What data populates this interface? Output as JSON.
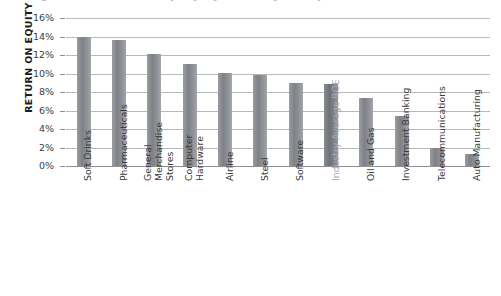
{
  "title_sliver": "Figure 1  Return on Equity by Industry Group",
  "axis": {
    "y_title": "RETURN ON EQUITY",
    "y_ticks": [
      "0%",
      "2%",
      "4%",
      "6%",
      "8%",
      "10%",
      "12%",
      "14%",
      "16%"
    ]
  },
  "colors": {
    "bar": "#85888d",
    "bar_highlight": "#75787d",
    "gridline": "#b6b8ba",
    "axis_text": "#3d3d3d",
    "muted_label": "#a8abb0"
  },
  "chart_data": {
    "type": "bar",
    "title": "Figure 1  Return on Equity by Industry Group",
    "xlabel": "",
    "ylabel": "RETURN ON EQUITY",
    "ylim": [
      0,
      16
    ],
    "ytick_values": [
      0,
      2,
      4,
      6,
      8,
      10,
      12,
      14,
      16
    ],
    "ytick_labels": [
      "0%",
      "2%",
      "4%",
      "6%",
      "8%",
      "10%",
      "12%",
      "14%",
      "16%"
    ],
    "y_unit": "percent",
    "grid": true,
    "legend": false,
    "orientation": "vertical",
    "categories": [
      "Soft Drinks",
      "Pharmaceuticals",
      "General Merchandise Stores",
      "Computer Hardware",
      "Airline",
      "Steel",
      "Software",
      "Industry Average ROE",
      "Oil and Gas",
      "Investment Banking",
      "Telecommunications",
      "Auto Manufacturing"
    ],
    "category_lines": [
      [
        "Soft Drinks"
      ],
      [
        "Pharmaceuticals"
      ],
      [
        "General",
        "Merchandise",
        "Stores"
      ],
      [
        "Computer",
        "Hardware"
      ],
      [
        "Airline"
      ],
      [
        "Steel"
      ],
      [
        "Software"
      ],
      [
        "Industry Average ROE"
      ],
      [
        "Oil and Gas"
      ],
      [
        "Investment Banking"
      ],
      [
        "Telecommunications"
      ],
      [
        "Auto Manufacturing"
      ]
    ],
    "values": [
      14.0,
      13.6,
      12.1,
      11.0,
      10.1,
      9.8,
      9.0,
      8.9,
      7.3,
      5.4,
      2.0,
      1.3
    ],
    "highlight_index": 7,
    "highlight_label": "Industry Average ROE"
  }
}
